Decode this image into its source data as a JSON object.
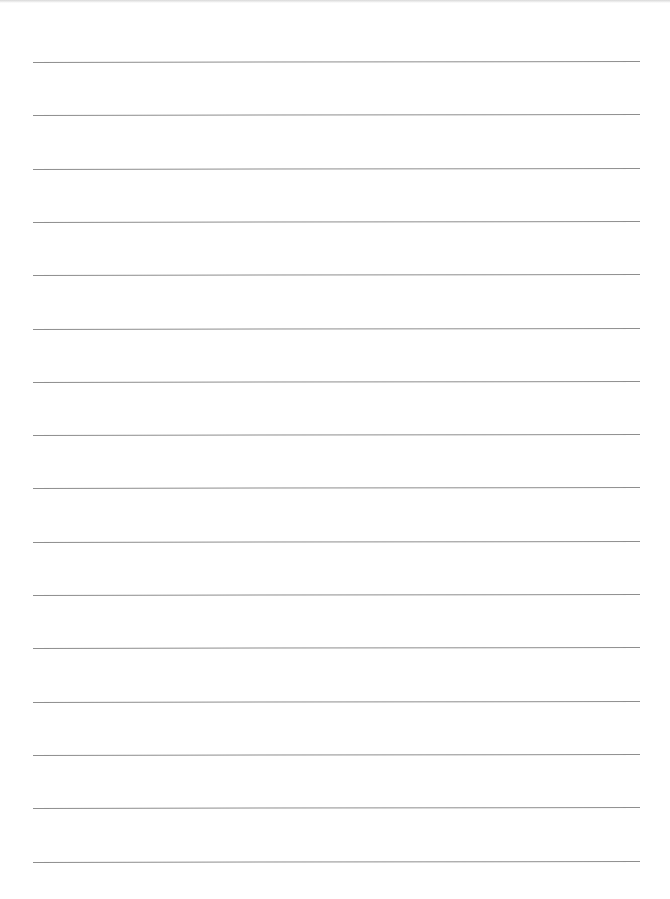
{
  "page": {
    "type": "lined-paper",
    "line_count": 16,
    "line_color": "#8e8e8e",
    "background": "#ffffff",
    "first_line_y": 62,
    "line_spacing": 53.3,
    "line_left": 33,
    "line_width": 607
  }
}
